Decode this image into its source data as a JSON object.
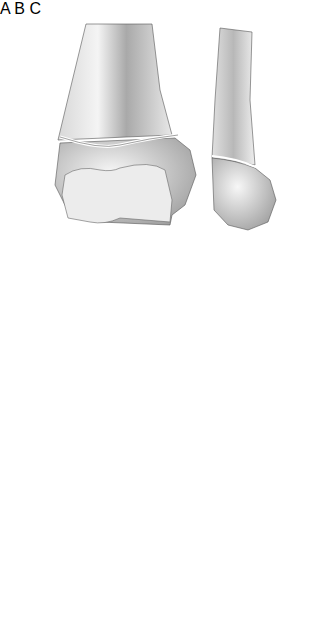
{
  "figure": {
    "panels": [
      {
        "label": "A",
        "description": "Distal femur fracture, anterior and lateral views"
      },
      {
        "label": "B",
        "description": "Cross-section bone fragment"
      },
      {
        "label": "C",
        "description": "Distal bone with displaced articular fragment, lateral and anterior views"
      }
    ]
  }
}
